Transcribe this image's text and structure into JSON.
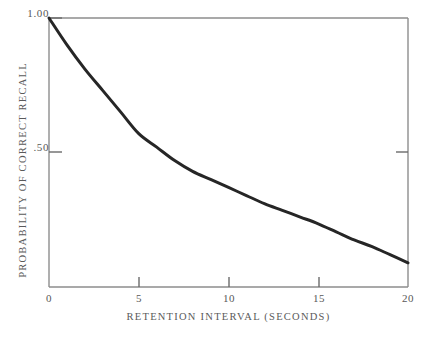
{
  "chart_data": {
    "type": "line",
    "title": "",
    "subtitle": "",
    "xlabel": "RETENTION INTERVAL (SECONDS)",
    "ylabel": "PROBABILITY OF CORRECT RECALL",
    "xlim": [
      0,
      20
    ],
    "ylim": [
      0.0,
      1.0
    ],
    "grid": false,
    "legend": null,
    "legend_position": "none",
    "x_ticks": [
      0,
      5,
      10,
      15,
      20
    ],
    "x_tick_labels": [
      "0",
      "5",
      "10",
      "15",
      "20"
    ],
    "y_ticks": [
      0.5,
      1.0
    ],
    "y_tick_labels": [
      ".50",
      "1.00"
    ],
    "annotations": [],
    "series": [
      {
        "name": "Probability of correct recall",
        "color": "#262626",
        "line_width": 3,
        "x": [
          0,
          1,
          2,
          3,
          4,
          5,
          6,
          7,
          8,
          9,
          10,
          11,
          12,
          13,
          14,
          15,
          16,
          17,
          18,
          19,
          20
        ],
        "values": [
          1.0,
          0.9,
          0.81,
          0.73,
          0.65,
          0.57,
          0.52,
          0.47,
          0.43,
          0.4,
          0.37,
          0.34,
          0.31,
          0.285,
          0.26,
          0.235,
          0.205,
          0.175,
          0.15,
          0.12,
          0.09
        ]
      }
    ]
  },
  "axes": {
    "frame": {
      "left_px": 49,
      "right_px": 408,
      "top_px": 18,
      "bottom_px": 287
    },
    "frame_color": "#8d8d8d",
    "tick_color": "#6b6b6b"
  },
  "figure": {
    "background": "#ffffff"
  }
}
